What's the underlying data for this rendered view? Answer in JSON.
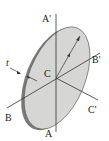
{
  "figure": {
    "type": "thin-disk-with-axes",
    "labels": {
      "top_axis": "A'",
      "bottom_axis": "A",
      "left_axis": "B",
      "right_axis": "B'",
      "lower_right_axis": "C'",
      "center": "C",
      "thickness": "t",
      "radius": "r"
    },
    "colors": {
      "disk_face": "#d4d4d2",
      "disk_rim": "#7a7a78",
      "lines": "#333333",
      "background": "#ffffff"
    }
  }
}
